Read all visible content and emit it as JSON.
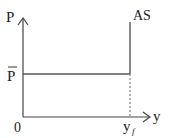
{
  "diagram": {
    "type": "economics-aggregate-supply",
    "y_axis_label": "P",
    "x_axis_label": "y",
    "origin_label": "0",
    "price_level_label": "P",
    "price_level_bar": "overline",
    "curve_label": "AS",
    "output_label_main": "y",
    "output_label_sub": "f",
    "colors": {
      "axis": "#444444",
      "curve": "#555555",
      "text": "#222222",
      "dashed": "#777777"
    }
  }
}
